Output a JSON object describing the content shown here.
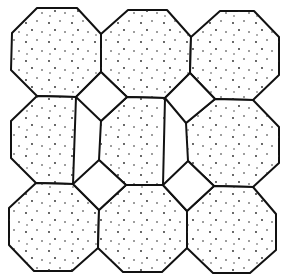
{
  "diagram": {
    "colors": {
      "stroke": "#111111",
      "fill": "#ffffff",
      "dots": "#222222"
    },
    "octagons": [
      {
        "id": "oct-r1c1",
        "points": "37,8 77,8 101,34 101,72 76,97 37,96 11,70 12,33"
      },
      {
        "id": "oct-r1c2",
        "points": "128,10 167,10 191,37 190,73 165,98 127,97 101,72 101,34"
      },
      {
        "id": "oct-r1c3",
        "points": "220,11 254,11 279,37 279,75 253,100 215,99 190,73 191,37"
      },
      {
        "id": "oct-r2c1",
        "points": "37,96 76,97 76,97 73,184 36,183 11,158 11,121"
      },
      {
        "id": "oct-r2c2",
        "points": "127,97 165,98 165,98 163,185 126,185 99,160 101,121 127,97"
      },
      {
        "id": "oct-r2c3",
        "points": "215,99 253,100 279,127 279,163 253,187 214,186 188,161 186,123"
      },
      {
        "id": "oct-r3c1",
        "points": "36,183 73,184 99,210 98,248 72,271 34,271 9,245 9,208"
      },
      {
        "id": "oct-r3c2",
        "points": "126,185 163,185 187,211 187,248 162,272 123,272 98,248 99,210"
      },
      {
        "id": "oct-r3c3",
        "points": "214,186 253,187 276,214 276,250 250,273 213,273 187,248 187,211"
      }
    ],
    "squares": [
      {
        "id": "square-1",
        "points": "101,72 127,97 101,121 76,97"
      },
      {
        "id": "square-2",
        "points": "190,73 215,99 186,123 165,98"
      },
      {
        "id": "square-3",
        "points": "99,160 126,185 99,210 73,184"
      },
      {
        "id": "square-4",
        "points": "188,161 214,186 187,211 163,185"
      }
    ]
  }
}
